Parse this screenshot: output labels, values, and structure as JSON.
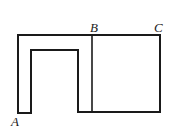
{
  "diagram": {
    "type": "geometry-figure",
    "stroke_color": "#1a1a1a",
    "background": "#ffffff",
    "labels": {
      "A": "A",
      "B": "B",
      "C": "C"
    },
    "points": {
      "A": [
        18,
        113
      ],
      "B": [
        92,
        35
      ],
      "C": [
        160,
        35
      ]
    },
    "outline_path": [
      [
        18,
        113
      ],
      [
        18,
        35
      ],
      [
        160,
        35
      ],
      [
        160,
        112
      ],
      [
        78,
        112
      ],
      [
        78,
        50
      ],
      [
        31,
        50
      ],
      [
        31,
        113
      ],
      [
        18,
        113
      ]
    ],
    "divider_line": [
      [
        92,
        35
      ],
      [
        92,
        112
      ]
    ]
  }
}
